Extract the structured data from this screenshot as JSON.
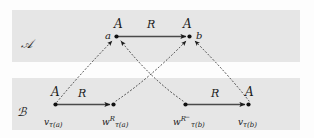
{
  "figure": {
    "type": "mathematical-diagram",
    "background_color": "#fdfdfd",
    "band_color": "#e6e6e6",
    "ink_color": "#1b1b1b",
    "bands": [
      {
        "id": "band-A",
        "label": "ℬ-placeholder"
      }
    ]
  },
  "structures": {
    "upper": {
      "name": "A",
      "band_label": "𝒜",
      "relation_label": "R",
      "nodes": [
        {
          "id": "a",
          "point_label": "a",
          "type_label": "A"
        },
        {
          "id": "b",
          "point_label": "b",
          "type_label": "A"
        }
      ]
    },
    "lower": {
      "name": "B",
      "band_label": "ℬ",
      "nodes": [
        {
          "id": "v-tau-a",
          "type_label": "A",
          "base": "v",
          "subscript": "τ(a)",
          "superscript": ""
        },
        {
          "id": "w-R-tau-a",
          "type_label": "",
          "base": "w",
          "subscript": "τ(a)",
          "superscript": "R"
        },
        {
          "id": "w-Rminus-tau-b",
          "type_label": "",
          "base": "w",
          "subscript": "τ(b)",
          "superscript": "R",
          "superscript_minus": "−"
        },
        {
          "id": "v-tau-b",
          "type_label": "A",
          "base": "v",
          "subscript": "τ(b)",
          "superscript": ""
        }
      ],
      "relation_labels": [
        "R",
        "R"
      ]
    }
  },
  "labels": {
    "A_upper_left": "A",
    "A_upper_right": "A",
    "R_upper": "R",
    "a": "a",
    "b": "b",
    "cal_A": "𝒜",
    "cal_B": "ℬ",
    "A_lower_left": "A",
    "A_lower_right": "A",
    "R_lower_left": "R",
    "R_lower_right": "R",
    "v_base": "v",
    "w_base": "w",
    "tau_a": "τ(a)",
    "tau_b": "τ(b)",
    "R_sup": "R",
    "minus_sup": "−"
  }
}
